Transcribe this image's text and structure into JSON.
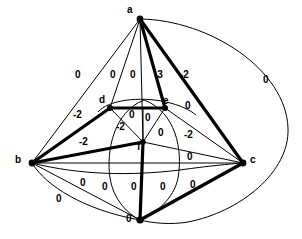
{
  "figure": {
    "kind": "weighted-graph-diagram",
    "background_color": "#ffffff",
    "ink_color": "#000000",
    "width": 302,
    "height": 239
  },
  "vertices": [
    {
      "id": "a",
      "label": "a",
      "x": 140,
      "y": 19,
      "label_x": 127,
      "label_y": 5,
      "dot": true
    },
    {
      "id": "b",
      "label": "b",
      "x": 32,
      "y": 163,
      "label_x": 15,
      "label_y": 155,
      "dot": true
    },
    {
      "id": "c",
      "label": "c",
      "x": 243,
      "y": 163,
      "label_x": 250,
      "label_y": 155,
      "dot": true
    },
    {
      "id": "d",
      "label": "d",
      "x": 110,
      "y": 108,
      "label_x": 99,
      "label_y": 95,
      "dot": true
    },
    {
      "id": "e",
      "label": "e",
      "x": 165,
      "y": 108,
      "label_x": 163,
      "label_y": 96,
      "dot": true
    },
    {
      "id": "f",
      "label": "f",
      "x": 143,
      "y": 142,
      "label_x": 137,
      "label_y": 142,
      "dot": true
    },
    {
      "id": "g",
      "label": "",
      "x": 140,
      "y": 220,
      "label_x": 0,
      "label_y": 0,
      "dot": true
    }
  ],
  "weights": [
    {
      "id": "w-b-a-outer",
      "text": "0",
      "x": 75,
      "y": 70
    },
    {
      "id": "w-a-d",
      "text": "0",
      "x": 110,
      "y": 70
    },
    {
      "id": "w-a-f",
      "text": "0",
      "x": 130,
      "y": 70
    },
    {
      "id": "w-a-e",
      "text": "-3",
      "x": 157,
      "y": 70
    },
    {
      "id": "w-a-c",
      "text": "-2",
      "x": 182,
      "y": 70
    },
    {
      "id": "w-a-c-outer",
      "text": "0",
      "x": 263,
      "y": 75
    },
    {
      "id": "w-e-a-right",
      "text": "0",
      "x": 185,
      "y": 101
    },
    {
      "id": "w-b-d",
      "text": "-2",
      "x": 76,
      "y": 110
    },
    {
      "id": "w-d-f",
      "text": "-2",
      "x": 118,
      "y": 122
    },
    {
      "id": "w-d-e",
      "text": "0",
      "x": 129,
      "y": 110
    },
    {
      "id": "w-e-f-upper",
      "text": "0",
      "x": 145,
      "y": 113
    },
    {
      "id": "w-e-f-lower",
      "text": "0",
      "x": 160,
      "y": 128
    },
    {
      "id": "w-e-c",
      "text": "-2",
      "x": 186,
      "y": 130
    },
    {
      "id": "w-b-f",
      "text": "-2",
      "x": 82,
      "y": 137
    },
    {
      "id": "w-f-c",
      "text": "0",
      "x": 187,
      "y": 152
    },
    {
      "id": "w-b-c",
      "text": "0",
      "x": 80,
      "y": 178
    },
    {
      "id": "w-b-g-left",
      "text": "0",
      "x": 102,
      "y": 182
    },
    {
      "id": "w-f-g",
      "text": "0",
      "x": 131,
      "y": 182
    },
    {
      "id": "w-g-c-inner",
      "text": "0",
      "x": 160,
      "y": 182
    },
    {
      "id": "w-g-c",
      "text": "0",
      "x": 190,
      "y": 180
    },
    {
      "id": "w-b-g-outer",
      "text": "0",
      "x": 56,
      "y": 194
    },
    {
      "id": "w-g-bottom",
      "text": "0",
      "x": 128,
      "y": 215
    }
  ],
  "edges": {
    "bold": [
      {
        "id": "edge-a-e",
        "from": "a",
        "to": "e"
      },
      {
        "id": "edge-a-c",
        "from": "a",
        "to": "c"
      },
      {
        "id": "edge-b-d",
        "from": "b",
        "to": "d"
      },
      {
        "id": "edge-b-f",
        "from": "b",
        "to": "f"
      },
      {
        "id": "edge-d-e",
        "from": "d",
        "to": "e"
      },
      {
        "id": "edge-f-g",
        "from": "f",
        "to": "g"
      },
      {
        "id": "edge-g-c",
        "from": "g",
        "to": "c"
      }
    ],
    "thin": [
      {
        "id": "edge-a-b",
        "from": "a",
        "to": "b"
      },
      {
        "id": "edge-a-d",
        "from": "a",
        "to": "d"
      },
      {
        "id": "edge-a-f",
        "from": "a",
        "to": "f"
      },
      {
        "id": "edge-b-c",
        "from": "b",
        "to": "c"
      },
      {
        "id": "edge-d-f",
        "from": "d",
        "to": "f"
      },
      {
        "id": "edge-e-f",
        "from": "e",
        "to": "f"
      },
      {
        "id": "edge-e-c",
        "from": "e",
        "to": "c"
      },
      {
        "id": "edge-f-c",
        "from": "f",
        "to": "c"
      },
      {
        "id": "edge-b-g",
        "from": "b",
        "to": "g"
      }
    ],
    "curved": [
      {
        "id": "arc-a-c-outer",
        "desc": "large outer arc a to c around right"
      },
      {
        "id": "arc-a-g-outer",
        "desc": "large outer arc continues c to bottom"
      },
      {
        "id": "arc-b-g-outer",
        "desc": "outer arc b to bottom vertex"
      },
      {
        "id": "arc-d-e-top",
        "desc": "small arc above d-e"
      },
      {
        "id": "lens-left",
        "desc": "left side of central vertical lens"
      },
      {
        "id": "lens-right",
        "desc": "right side of central vertical lens"
      },
      {
        "id": "arc-b-f-low",
        "desc": "shallow curve b toward f / c"
      }
    ]
  }
}
